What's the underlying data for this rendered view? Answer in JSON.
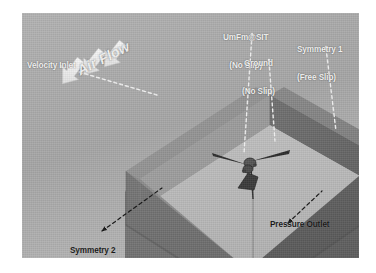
{
  "figure": {
    "kind": "cfd-computational-domain-diagram",
    "panel": {
      "background_color": "#a9a9a9",
      "x": 22,
      "y": 13,
      "width": 337,
      "height": 245
    },
    "colors": {
      "panel_background": "#a9a9a9",
      "box_top_rim": "#8f8f8f",
      "box_outer_wall_left": "#6f6f6f",
      "box_outer_wall_right": "#5f5f5f",
      "box_inner_wall_back_left": "#9b9b9b",
      "box_inner_wall_back_right": "#6a6a6a",
      "box_floor": "#b9b9b9",
      "arrow_white": "#f0f0f0",
      "leader_light": "#f2f2f2",
      "leader_dark": "#1a1a1a",
      "text_dark": "#161616",
      "text_light": "#f4f4f4"
    }
  },
  "labels": {
    "air_flow": {
      "text": "Air Flow",
      "style": "light-italic-rotated",
      "x": 62,
      "y": 62
    },
    "velocity_inlet": {
      "text": "Velocity Inlet",
      "style": "light",
      "x": 27,
      "y": 58,
      "leader": "dashed-light"
    },
    "umfm_sit": {
      "line1": "UmFm@SIT",
      "line2": "(No Slip)",
      "style": "light",
      "x": 237,
      "y": 16,
      "leader": "dashed-light"
    },
    "ground": {
      "line1": "Ground",
      "line2": "(No Slip)",
      "style": "light",
      "x": 253,
      "y": 42,
      "leader": "dashed-light"
    },
    "symmetry_1": {
      "line1": "Symmetry 1",
      "line2": "(Free Slip)",
      "style": "light",
      "x": 300,
      "y": 28,
      "leader": "dashed-light"
    },
    "symmetry_2": {
      "line1": "Symmetry 2",
      "line2": "(Free Slip)",
      "style": "dark",
      "x": 70,
      "y": 230,
      "leader": "dashed-dark-arrow"
    },
    "pressure_outlet": {
      "text": "Pressure Outlet",
      "style": "dark",
      "x": 275,
      "y": 211,
      "leader": "dashed-dark-arrow"
    }
  },
  "flow_arrows": {
    "count": 3,
    "color": "#f0f0f0",
    "direction": "down-right-into-inlet-face",
    "angle_deg": 38
  },
  "model": {
    "name": "wind-turbine-model",
    "description": "small dark turbine model with rotor and tower at the center of the domain floor",
    "position": {
      "x": 173,
      "y": 147
    }
  },
  "boundary_conditions": [
    {
      "name": "Velocity Inlet",
      "type": "velocity-inlet"
    },
    {
      "name": "Pressure Outlet",
      "type": "pressure-outlet"
    },
    {
      "name": "UmFm@SIT",
      "type": "No Slip"
    },
    {
      "name": "Ground",
      "type": "No Slip"
    },
    {
      "name": "Symmetry 1",
      "type": "Free Slip"
    },
    {
      "name": "Symmetry 2",
      "type": "Free Slip"
    }
  ]
}
